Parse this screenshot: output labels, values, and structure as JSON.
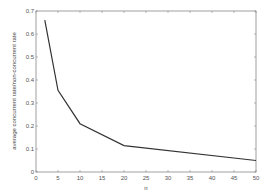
{
  "chart_data": {
    "type": "line",
    "title": "",
    "xlabel": "n",
    "ylabel": "average concurrent rate/non-concurrent rate",
    "xlim": [
      0,
      50
    ],
    "ylim": [
      0,
      0.7
    ],
    "xticks": [
      0,
      5,
      10,
      15,
      20,
      25,
      30,
      35,
      40,
      45,
      50
    ],
    "yticks": [
      0,
      0.1,
      0.2,
      0.3,
      0.4,
      0.5,
      0.6,
      0.7
    ],
    "grid": false,
    "legend": null,
    "series": [
      {
        "name": "ratio",
        "color": "#333333",
        "x": [
          2,
          5,
          10,
          20,
          50
        ],
        "y": [
          0.66,
          0.355,
          0.21,
          0.115,
          0.05
        ]
      }
    ]
  }
}
